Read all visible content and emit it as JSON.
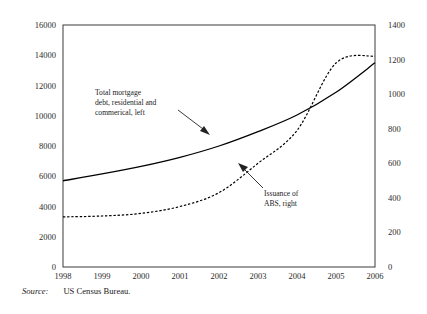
{
  "figure": {
    "source_key": "Source:",
    "source_value": "US Census Bureau."
  },
  "annotations": {
    "left_series": {
      "line1": "Total mortgage",
      "line2": "debt, residential and",
      "line3": "commerical, left"
    },
    "right_series": {
      "line1": "Issuance of",
      "line2": "ABS, right"
    }
  },
  "chart_data": {
    "type": "line",
    "title": "",
    "xlabel": "",
    "grid": false,
    "legend": "annotations-inline",
    "x": [
      1998,
      1999,
      2000,
      2001,
      2002,
      2003,
      2004,
      2005,
      2006
    ],
    "xticklabels": [
      "1998",
      "1999",
      "2000",
      "2001",
      "2002",
      "2003",
      "2004",
      "2005",
      "2006"
    ],
    "xlim": [
      1998,
      2006
    ],
    "axes": {
      "left": {
        "label": "Total mortgage debt, residential and commerical, left",
        "ylim": [
          0,
          16000
        ],
        "yticks": [
          0,
          2000,
          4000,
          6000,
          8000,
          10000,
          12000,
          14000,
          16000
        ],
        "yticklabels": [
          "0",
          "2000",
          "4000",
          "6000",
          "8000",
          "10000",
          "12000",
          "14000",
          "16000"
        ]
      },
      "right": {
        "label": "Issuance of ABS, right",
        "ylim": [
          0,
          1400
        ],
        "yticks": [
          0,
          200,
          400,
          600,
          800,
          1000,
          1200,
          1400
        ],
        "yticklabels": [
          "0",
          "200",
          "400",
          "600",
          "800",
          "1000",
          "1200",
          "1400"
        ]
      }
    },
    "series": [
      {
        "name": "Total mortgage debt, residential and commerical",
        "axis": "left",
        "style": "solid",
        "color": "#000000",
        "values": [
          5700,
          6150,
          6650,
          7250,
          8000,
          8950,
          10050,
          11550,
          13500
        ]
      },
      {
        "name": "Issuance of ABS",
        "axis": "right",
        "style": "dashed",
        "color": "#000000",
        "values": [
          290,
          295,
          310,
          350,
          430,
          600,
          790,
          1180,
          1220
        ]
      }
    ]
  }
}
